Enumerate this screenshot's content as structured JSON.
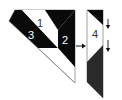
{
  "diagram": {
    "labels": {
      "piece1": "1",
      "piece2": "2",
      "piece3": "3",
      "piece4": "4"
    },
    "colors": {
      "black": "#0a0a0a",
      "dark_gray": "#2a2a2a",
      "outline": "#888888",
      "white": "#ffffff",
      "label_light": "#ffffff",
      "label_dark": "#333333"
    },
    "arrows": {
      "right_arrow": "→",
      "down_arrow_top": "↓",
      "down_arrow_bottom": "↓"
    }
  }
}
